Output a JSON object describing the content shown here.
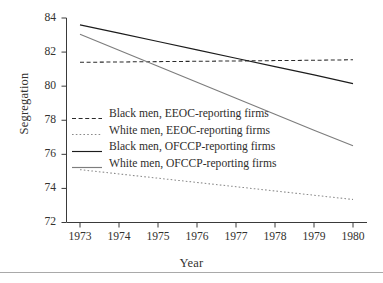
{
  "chart_data": {
    "type": "line",
    "title": "",
    "xlabel": "Year",
    "ylabel": "Segregation",
    "x": [
      1973,
      1974,
      1975,
      1976,
      1977,
      1978,
      1979,
      1980
    ],
    "xlim": [
      1972.6,
      1980.4
    ],
    "ylim": [
      72,
      84
    ],
    "yticks": [
      72,
      74,
      76,
      78,
      80,
      82,
      84
    ],
    "xticks": [
      "1973",
      "1974",
      "1975",
      "1976",
      "1977",
      "1978",
      "1979",
      "1980"
    ],
    "ytick_labels": [
      "72",
      "74",
      "76",
      "78",
      "80",
      "82",
      "84"
    ],
    "grid": false,
    "legend_position": "center-left-inside",
    "series": [
      {
        "name": "Black men, EEOC-reporting firms",
        "style": "dashed",
        "color": "#2b2b2b",
        "values": [
          81.4,
          81.42,
          81.44,
          81.46,
          81.48,
          81.5,
          81.52,
          81.55
        ]
      },
      {
        "name": "White men, EEOC-reporting firms",
        "style": "dotted",
        "color": "#8a8a8a",
        "values": [
          75.1,
          74.85,
          74.6,
          74.35,
          74.1,
          73.85,
          73.6,
          73.35
        ]
      },
      {
        "name": "Black men, OFCCP-reporting firms",
        "style": "solid",
        "color": "#1c1c1c",
        "values": [
          83.6,
          83.11,
          82.62,
          82.13,
          81.64,
          81.15,
          80.66,
          80.15
        ]
      },
      {
        "name": "White men, OFCCP-reporting firms",
        "style": "solid",
        "color": "#7d7d7d",
        "values": [
          83.05,
          82.11,
          81.17,
          80.23,
          79.29,
          78.35,
          77.41,
          76.5
        ]
      }
    ]
  },
  "legend": {
    "items": [
      {
        "label": "Black men, EEOC-reporting firms"
      },
      {
        "label": "White men, EEOC-reporting firms"
      },
      {
        "label": "Black men, OFCCP-reporting firms"
      },
      {
        "label": "White men, OFCCP-reporting firms"
      }
    ]
  }
}
